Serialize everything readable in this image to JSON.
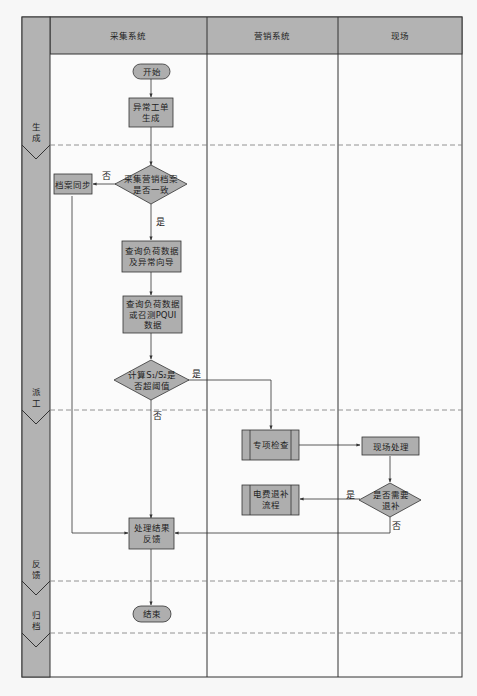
{
  "colors": {
    "background": "#f7f7f7",
    "header_fill": "#b3b3b3",
    "node_fill": "#aeaeae",
    "phase_fill": "#b3b3b3",
    "line": "#333333",
    "dash": "#7a7a7a"
  },
  "lanes": [
    {
      "label": "采集系统"
    },
    {
      "label": "营销系统"
    },
    {
      "label": "现场"
    }
  ],
  "phases": [
    {
      "label_line1": "生",
      "label_line2": "成"
    },
    {
      "label_line1": "派",
      "label_line2": "工"
    },
    {
      "label_line1": "反",
      "label_line2": "馈"
    },
    {
      "label_line1": "归",
      "label_line2": "档"
    }
  ],
  "nodes": {
    "start": {
      "label": "开始",
      "shape": "terminator"
    },
    "abnormal_ticket": {
      "line1": "异常工单",
      "line2": "生成",
      "shape": "process"
    },
    "archive_consistent": {
      "line1": "采集营销档案",
      "line2": "是否一致",
      "shape": "decision"
    },
    "archive_sync": {
      "label": "档案同步",
      "shape": "process"
    },
    "query_load_guide": {
      "line1": "查询负荷数据",
      "line2": "及异常向导",
      "shape": "process"
    },
    "query_load_pqui": {
      "line1": "查询负荷数据",
      "line2": "或召测PQUI",
      "line3": "数据",
      "shape": "process"
    },
    "calc_threshold": {
      "line1": "计算S₁/S₂是",
      "line2": "否超阈值",
      "shape": "decision"
    },
    "special_check": {
      "label": "专项检查",
      "shape": "predefined-process"
    },
    "field_handling": {
      "label": "现场处理",
      "shape": "process"
    },
    "need_refund": {
      "line1": "是否需要",
      "line2": "退补",
      "shape": "decision"
    },
    "fee_refund_flow": {
      "line1": "电费退补",
      "line2": "流程",
      "shape": "predefined-process"
    },
    "result_feedback": {
      "line1": "处理结果",
      "line2": "反馈",
      "shape": "process"
    },
    "end": {
      "label": "结束",
      "shape": "terminator"
    }
  },
  "edge_labels": {
    "archive_no": "否",
    "archive_yes": "是",
    "threshold_yes": "是",
    "threshold_no": "否",
    "refund_yes": "是",
    "refund_no": "否"
  }
}
